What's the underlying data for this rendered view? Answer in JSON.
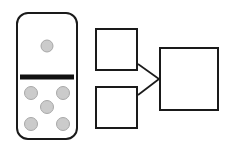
{
  "figure": {
    "title": "Domino tile with arrow diagram of two squares merging into one",
    "background_color": "#ffffff",
    "stroke_color": "#1a1a1a",
    "width": 230,
    "height": 146
  },
  "domino": {
    "name": "domino-tile",
    "label": "Domino tile one and five",
    "x": 16,
    "y": 12,
    "width": 62,
    "height": 128,
    "corner_radius": 11,
    "fill_color": "#ffffff",
    "border_color": "#1a1a1a",
    "border_width": 2,
    "divider": {
      "label": "domino divider bar",
      "x1": 20,
      "x2": 74,
      "y": 77,
      "thickness": 5,
      "color": "#111111"
    },
    "top_half": {
      "label": "top half one pip",
      "pip_count": 1,
      "pips": [
        {
          "cx": 47,
          "cy": 46,
          "r": 6
        }
      ]
    },
    "bottom_half": {
      "label": "bottom half five pips",
      "pip_count": 5,
      "pips": [
        {
          "cx": 31,
          "cy": 93,
          "r": 6.5
        },
        {
          "cx": 63,
          "cy": 93,
          "r": 6.5
        },
        {
          "cx": 47,
          "cy": 107,
          "r": 6.5
        },
        {
          "cx": 31,
          "cy": 124,
          "r": 6.5
        },
        {
          "cx": 63,
          "cy": 124,
          "r": 6.5
        }
      ]
    },
    "pip_style": {
      "fill_color": "#cbcbcb",
      "border_color": "#a8a8a8",
      "border_width": 1
    }
  },
  "diagram": {
    "name": "merge-diagram",
    "label": "Two source squares connected to one target square",
    "boxes": [
      {
        "name": "source-box-top",
        "label": "top source square",
        "x": 95,
        "y": 28,
        "width": 43,
        "height": 43,
        "fill_color": "#ffffff",
        "border_color": "#1a1a1a",
        "border_width": 2
      },
      {
        "name": "source-box-bottom",
        "label": "bottom source square",
        "x": 95,
        "y": 86,
        "width": 43,
        "height": 43,
        "fill_color": "#ffffff",
        "border_color": "#1a1a1a",
        "border_width": 2
      },
      {
        "name": "target-box",
        "label": "target square",
        "x": 159,
        "y": 47,
        "width": 60,
        "height": 64,
        "fill_color": "#ffffff",
        "border_color": "#1a1a1a",
        "border_width": 2
      }
    ],
    "connectors": [
      {
        "name": "connector-top",
        "label": "line from top square to target",
        "x1": 138,
        "y1": 64,
        "x2": 159,
        "y2": 79,
        "color": "#1a1a1a",
        "width": 1.6
      },
      {
        "name": "connector-bottom",
        "label": "line from bottom square to target",
        "x1": 138,
        "y1": 95,
        "x2": 159,
        "y2": 79,
        "color": "#1a1a1a",
        "width": 1.6
      }
    ],
    "junction": {
      "name": "connector-junction",
      "label": "convergence point",
      "x": 159,
      "y": 79
    }
  }
}
